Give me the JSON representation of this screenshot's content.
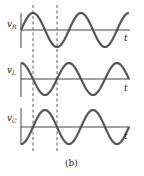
{
  "figure": {
    "caption": "(b)",
    "time_label": "t",
    "colors": {
      "curve": "#555555",
      "axis": "#444444",
      "dash": "#333333"
    },
    "panels": [
      {
        "label": "v",
        "subscript": "R",
        "phase": "sine, starts at zero rising"
      },
      {
        "label": "v",
        "subscript": "L",
        "phase": "leads vR by 90°, starts at maximum"
      },
      {
        "label": "v",
        "subscript": "C",
        "phase": "lags vR by 90°, starts at minimum"
      }
    ]
  },
  "chart_data": {
    "type": "line",
    "title": "",
    "xlabel": "t",
    "series": [
      {
        "name": "vR",
        "function": "sin(ωt)"
      },
      {
        "name": "vL",
        "function": "cos(ωt)"
      },
      {
        "name": "vC",
        "function": "-cos(ωt)"
      }
    ],
    "annotations": [
      "dashed vertical line at vR peak (ωt = π/2)",
      "dashed vertical line at vR trough (ωt = 3π/2)"
    ],
    "cycles_shown": 2.25
  }
}
